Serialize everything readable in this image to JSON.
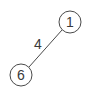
{
  "diagram": {
    "type": "graph",
    "nodes": [
      {
        "id": "1",
        "label": "1",
        "cx": 70,
        "cy": 22,
        "r": 11
      },
      {
        "id": "6",
        "label": "6",
        "cx": 21,
        "cy": 75,
        "r": 11
      }
    ],
    "edges": [
      {
        "from": "1",
        "to": "6",
        "label": "4",
        "label_x": 38,
        "label_y": 44
      }
    ],
    "colors": {
      "stroke": "#4a4a4a",
      "text": "#3a3a3a",
      "background": "#ffffff"
    }
  }
}
